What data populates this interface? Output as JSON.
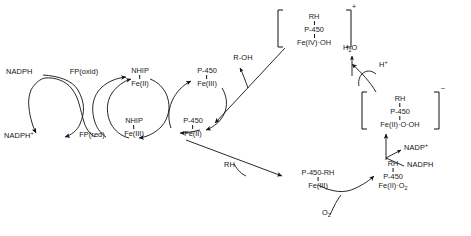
{
  "diagram": {
    "type": "biochemical-reaction-scheme",
    "stroke_color": "#111111",
    "background_color": "#ffffff"
  },
  "flavoprotein_cycle": {
    "nadph_in": "NADPH",
    "nadph_out": "NADPH",
    "nadph_out_charge": "+",
    "fp_oxidized": "FP(oxid)",
    "fp_reduced": "FP(red)"
  },
  "nhip_cycle": {
    "top_line1": "NHIP",
    "top_line2": "Fe(II)",
    "bottom_line1": "NHIP",
    "bottom_line2": "Fe(III)"
  },
  "p450_cycle": {
    "ferric_line1": "P-450",
    "ferric_line2": "Fe(III)",
    "ferrous_line1": "P-450",
    "ferrous_line2": "Fe(II)"
  },
  "substrate_complex": {
    "line1": "P-450-RH",
    "line2": "Fe(III)",
    "substrate_label": "RH"
  },
  "oxy_complex": {
    "line1": "RH",
    "line2": "P-450",
    "line3": "Fe(II)·O",
    "line3_sub": "2",
    "oxygen_label": "O",
    "oxygen_sub": "2"
  },
  "peroxo_bracket": {
    "line1": "RH",
    "line2": "P-450",
    "line3": "Fe(II)·O·OH",
    "charge": "–",
    "bracket_open": "[",
    "bracket_close": "]"
  },
  "oxenoid_bracket": {
    "line1": "RH",
    "line2": "P-450",
    "line3": "Fe(IV)·OH",
    "charge": "+",
    "bracket_open": "[",
    "bracket_close": "]"
  },
  "cofactors": {
    "nadp_plus": "NADP",
    "nadp_plus_charge": "+",
    "nadph": "NADPH",
    "water": "H",
    "water_sub": "2",
    "water_tail": "O",
    "proton": "H",
    "proton_charge": "+"
  },
  "product": {
    "label": "R-OH"
  }
}
